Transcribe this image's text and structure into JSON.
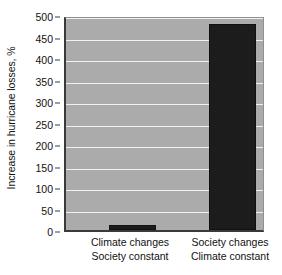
{
  "chart_data": {
    "type": "bar",
    "title": "",
    "xlabel": "",
    "ylabel": "Increase in hurricane losses, %",
    "ylim": [
      0,
      500
    ],
    "yticks": [
      0,
      50,
      100,
      150,
      200,
      250,
      300,
      350,
      400,
      450,
      500
    ],
    "ytick_labels": [
      "0",
      "50",
      "100",
      "150",
      "200",
      "250",
      "300",
      "350",
      "400",
      "450",
      "500"
    ],
    "grid": true,
    "legend": null,
    "categories": [
      "Climate changes Society constant",
      "Society changes Climate constant"
    ],
    "category_lines": [
      [
        "Climate changes",
        "Society constant"
      ],
      [
        "Society changes",
        "Climate constant"
      ]
    ],
    "values": [
      12,
      480
    ],
    "colors": {
      "bar": "#1c1c1c",
      "plot_background": "#ababab",
      "gridline": "#f2f2f2",
      "axis": "#3a3a3a",
      "page_background": "#ffffff",
      "text": "#111111"
    }
  }
}
